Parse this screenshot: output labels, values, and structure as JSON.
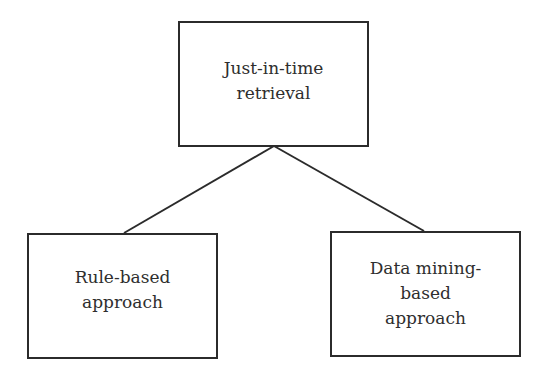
{
  "diagram": {
    "type": "tree",
    "root": {
      "label": "Just-in-time\nretrieval"
    },
    "children": [
      {
        "label": "Rule-based\napproach"
      },
      {
        "label": "Data mining-\nbased\napproach"
      }
    ],
    "colors": {
      "stroke": "#2b2b2b",
      "text": "#2e2e2e",
      "background": "#ffffff"
    }
  }
}
